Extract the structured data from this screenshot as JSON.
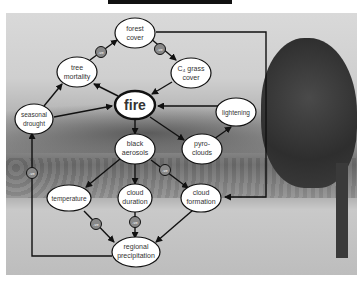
{
  "diagram": {
    "nodes": {
      "forest_cover": [
        "forest",
        "cover"
      ],
      "tree_mortality": [
        "tree",
        "mortality"
      ],
      "c4_grass_cover": [
        "C₄ grass",
        "cover"
      ],
      "fire": [
        "fire"
      ],
      "seasonal_drought": [
        "seasonal",
        "drought"
      ],
      "lightening": [
        "lightening"
      ],
      "black_aerosols": [
        "black",
        "aerosols"
      ],
      "pyro_clouds": [
        "pyro-",
        "clouds"
      ],
      "temperature": [
        "temperature"
      ],
      "cloud_duration": [
        "cloud",
        "duration"
      ],
      "cloud_formation": [
        "cloud",
        "formation"
      ],
      "regional_precipitation": [
        "regional",
        "precipitation"
      ]
    },
    "feedback_label": "-ve",
    "edges": [
      {
        "from": "tree mortality",
        "to": "forest cover",
        "sign": "-ve"
      },
      {
        "from": "forest cover",
        "to": "C4 grass cover",
        "sign": "-ve"
      },
      {
        "from": "C4 grass cover",
        "to": "fire"
      },
      {
        "from": "fire",
        "to": "tree mortality"
      },
      {
        "from": "seasonal drought",
        "to": "tree mortality"
      },
      {
        "from": "seasonal drought",
        "to": "fire"
      },
      {
        "from": "lightening",
        "to": "fire"
      },
      {
        "from": "fire",
        "to": "black aerosols"
      },
      {
        "from": "fire",
        "to": "pyro-clouds"
      },
      {
        "from": "pyro-clouds",
        "to": "lightening"
      },
      {
        "from": "black aerosols",
        "to": "temperature"
      },
      {
        "from": "black aerosols",
        "to": "cloud duration"
      },
      {
        "from": "black aerosols",
        "to": "cloud formation",
        "sign": "-ve"
      },
      {
        "from": "forest cover",
        "to": "cloud formation"
      },
      {
        "from": "temperature",
        "to": "regional precipitation",
        "sign": "-ve"
      },
      {
        "from": "cloud duration",
        "to": "regional precipitation",
        "sign": "-ve"
      },
      {
        "from": "cloud formation",
        "to": "regional precipitation"
      },
      {
        "from": "regional precipitation",
        "to": "seasonal drought",
        "sign": "-ve"
      }
    ]
  }
}
